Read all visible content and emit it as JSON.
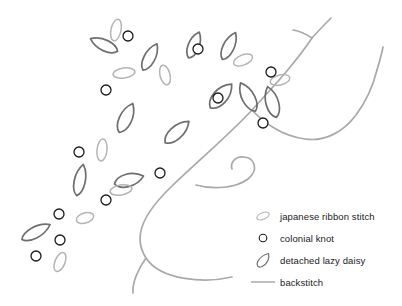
{
  "figure": {
    "background_color": "#ffffff"
  },
  "palette": {
    "backstitch_stem": "#a9a9a9",
    "detached_lazy_daisy": "#6e6e6e",
    "japanese_ribbon_stitch": "#b4b4b4",
    "colonial_knot": "#1a1a1a",
    "legend_text": "#1b1b1b"
  },
  "legend": {
    "items": [
      {
        "icon": "ribbon-stitch-ellipse-icon",
        "label": "japanese ribbon stitch",
        "color": "#b4b4b4"
      },
      {
        "icon": "colonial-knot-circle-icon",
        "label": "colonial knot",
        "color": "#1a1a1a"
      },
      {
        "icon": "lazy-daisy-petal-icon",
        "label": "detached lazy daisy",
        "color": "#6e6e6e"
      },
      {
        "icon": "backstitch-line-icon",
        "label": "backstitch",
        "color": "#a9a9a9"
      }
    ]
  },
  "artwork": {
    "stems": [
      "M 232 277 C 206 283 161 281 146 258 C 131 235 146 211 172 186 C 198 161 232 132 252 110",
      "M 252 110 C 262 99 276 84 286 72 C 297 59 306 47 312 38",
      "M 312 38 C 320 29 327 22 331 18",
      "M 252 110 C 262 121 281 136 305 139 C 326 142 344 131 356 115 C 368 99 374 82 377 70",
      "M 377 70 C 380 60 382 52 383 47",
      "M 196 185 C 214 190 236 188 248 179 C 259 170 255 158 244 157 C 235 156 230 163 232 169",
      "M 146 258 C 138 269 132 283 133 293",
      "M 312 38 C 306 34 299 31 293 30"
    ],
    "colonial_knots": [
      {
        "cx": 128,
        "cy": 36,
        "r": 5.0
      },
      {
        "cx": 106,
        "cy": 90,
        "r": 5.0
      },
      {
        "cx": 198,
        "cy": 49,
        "r": 5.0
      },
      {
        "cx": 218,
        "cy": 98,
        "r": 5.0
      },
      {
        "cx": 271,
        "cy": 72,
        "r": 5.0
      },
      {
        "cx": 263,
        "cy": 123,
        "r": 5.0
      },
      {
        "cx": 79,
        "cy": 152,
        "r": 5.0
      },
      {
        "cx": 160,
        "cy": 173,
        "r": 5.0
      },
      {
        "cx": 106,
        "cy": 200,
        "r": 5.0
      },
      {
        "cx": 59,
        "cy": 214,
        "r": 5.0
      },
      {
        "cx": 60,
        "cy": 240,
        "r": 5.0
      },
      {
        "cx": 36,
        "cy": 256,
        "r": 5.0
      }
    ],
    "lazy_daisy_petals": [
      {
        "cx": 104,
        "cy": 45,
        "rx": 7,
        "ry": 15,
        "rot": -65
      },
      {
        "cx": 150,
        "cy": 57,
        "rx": 7,
        "ry": 15,
        "rot": 28
      },
      {
        "cx": 126,
        "cy": 118,
        "rx": 8,
        "ry": 16,
        "rot": 25
      },
      {
        "cx": 177,
        "cy": 132,
        "rx": 8,
        "ry": 16,
        "rot": 48
      },
      {
        "cx": 129,
        "cy": 180,
        "rx": 8,
        "ry": 15,
        "rot": 75
      },
      {
        "cx": 80,
        "cy": 180,
        "rx": 7,
        "ry": 16,
        "rot": 12
      },
      {
        "cx": 36,
        "cy": 232,
        "rx": 7,
        "ry": 16,
        "rot": 62
      },
      {
        "cx": 229,
        "cy": 46,
        "rx": 7,
        "ry": 15,
        "rot": 26
      },
      {
        "cx": 221,
        "cy": 96,
        "rx": 9,
        "ry": 16,
        "rot": 42
      },
      {
        "cx": 248,
        "cy": 97,
        "rx": 8,
        "ry": 16,
        "rot": -28
      },
      {
        "cx": 272,
        "cy": 102,
        "rx": 8,
        "ry": 16,
        "rot": -16
      },
      {
        "cx": 194,
        "cy": 45,
        "rx": 7,
        "ry": 14,
        "rot": 22
      }
    ],
    "ribbon_stitches": [
      {
        "cx": 116,
        "cy": 30,
        "rx": 5,
        "ry": 11,
        "rot": 12
      },
      {
        "cx": 124,
        "cy": 73,
        "rx": 11,
        "ry": 5,
        "rot": -8
      },
      {
        "cx": 165,
        "cy": 75,
        "rx": 5,
        "ry": 10,
        "rot": -14
      },
      {
        "cx": 243,
        "cy": 60,
        "rx": 10,
        "ry": 5,
        "rot": -22
      },
      {
        "cx": 280,
        "cy": 80,
        "rx": 10,
        "ry": 5,
        "rot": -14
      },
      {
        "cx": 102,
        "cy": 150,
        "rx": 5,
        "ry": 11,
        "rot": 6
      },
      {
        "cx": 121,
        "cy": 190,
        "rx": 11,
        "ry": 5,
        "rot": -10
      },
      {
        "cx": 85,
        "cy": 218,
        "rx": 9,
        "ry": 5,
        "rot": -18
      },
      {
        "cx": 60,
        "cy": 262,
        "rx": 5,
        "ry": 10,
        "rot": 22
      }
    ],
    "icon_names": {
      "stem": "backstitch-stem",
      "knot": "colonial-knot",
      "petal": "detached-lazy-daisy-petal",
      "ribbon": "japanese-ribbon-stitch"
    }
  }
}
